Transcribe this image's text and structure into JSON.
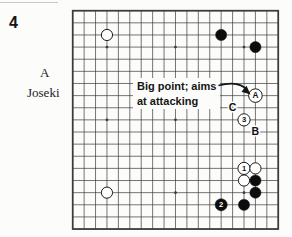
{
  "page": {
    "figure_number": "4",
    "label_letter": "A",
    "label_name": "Joseki"
  },
  "annotation": {
    "line1": "Big point; aims",
    "line2": "at attacking",
    "target": "A"
  },
  "colors": {
    "background": "#fcfcfb",
    "grid": "#3b3b3b",
    "black_stone": "#0d0d0d",
    "white_stone": "#ffffff",
    "text": "#151515"
  },
  "board": {
    "size": 19,
    "star_points": [
      [
        4,
        4
      ],
      [
        10,
        4
      ],
      [
        16,
        4
      ],
      [
        4,
        10
      ],
      [
        10,
        10
      ],
      [
        16,
        10
      ],
      [
        4,
        16
      ],
      [
        10,
        16
      ],
      [
        16,
        16
      ]
    ],
    "stones": [
      {
        "col": 4,
        "row": 3,
        "color": "white",
        "label": ""
      },
      {
        "col": 14,
        "row": 3,
        "color": "black",
        "label": ""
      },
      {
        "col": 17,
        "row": 4,
        "color": "black",
        "label": ""
      },
      {
        "col": 17,
        "row": 8,
        "color": "white",
        "label": "A"
      },
      {
        "col": 16,
        "row": 10,
        "color": "white",
        "label": "3"
      },
      {
        "col": 16,
        "row": 14,
        "color": "white",
        "label": "1"
      },
      {
        "col": 17,
        "row": 14,
        "color": "white",
        "label": ""
      },
      {
        "col": 16,
        "row": 15,
        "color": "white",
        "label": ""
      },
      {
        "col": 17,
        "row": 15,
        "color": "black",
        "label": ""
      },
      {
        "col": 17,
        "row": 16,
        "color": "black",
        "label": ""
      },
      {
        "col": 4,
        "row": 16,
        "color": "white",
        "label": ""
      },
      {
        "col": 14,
        "row": 17,
        "color": "black",
        "label": "2"
      },
      {
        "col": 16,
        "row": 17,
        "color": "black",
        "label": ""
      }
    ],
    "point_labels": [
      {
        "col": 15,
        "row": 9,
        "text": "C"
      },
      {
        "col": 17,
        "row": 11,
        "text": "B"
      }
    ]
  }
}
